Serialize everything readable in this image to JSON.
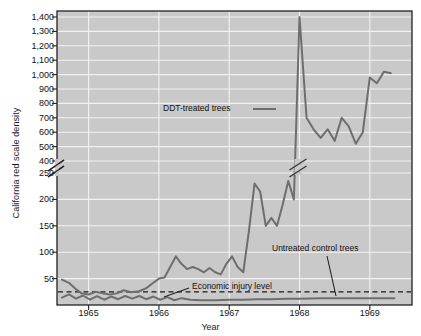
{
  "chart_data": {
    "type": "line",
    "title": "",
    "xlabel": "Year",
    "ylabel": "California red scale density",
    "xlim": [
      1964.55,
      1969.6
    ],
    "grid": true,
    "legend_position": "inline-annotations",
    "axis_break": {
      "present": true,
      "between": [
        250,
        400
      ],
      "note": "broken y-axis; lower segment 0-250 compressed relative to upper 400-1400"
    },
    "xticks": [
      1965,
      1966,
      1967,
      1968,
      1969
    ],
    "xtick_labels": [
      "1965",
      "1966",
      "1967",
      "1968",
      "1969"
    ],
    "yticks": [
      50,
      100,
      150,
      200,
      250,
      400,
      500,
      600,
      700,
      800,
      900,
      1000,
      1100,
      1200,
      1300,
      1400
    ],
    "ytick_labels": [
      "50",
      "100",
      "150",
      "200",
      "250",
      "400",
      "500",
      "600",
      "700",
      "800",
      "900",
      "1,000",
      "1,100",
      "1,200",
      "1,300",
      "1,400"
    ],
    "annotations": [
      {
        "name": "ddt-treated-trees",
        "text": "DDT-treated trees"
      },
      {
        "name": "untreated-control-trees",
        "text": "Untreated control trees"
      },
      {
        "name": "economic-injury-level",
        "text": "Economic injury level"
      }
    ],
    "reference_lines": [
      {
        "name": "economic-injury-level-line",
        "value": 25,
        "style": "dashed",
        "label": "Economic injury level"
      }
    ],
    "series": [
      {
        "name": "DDT-treated trees",
        "color": "#6e6e6e",
        "x": [
          1964.62,
          1964.72,
          1964.82,
          1964.9,
          1965.0,
          1965.1,
          1965.2,
          1965.3,
          1965.4,
          1965.5,
          1965.6,
          1965.72,
          1965.82,
          1965.92,
          1966.0,
          1966.08,
          1966.16,
          1966.24,
          1966.32,
          1966.4,
          1966.48,
          1966.56,
          1966.64,
          1966.72,
          1966.8,
          1966.88,
          1966.96,
          1967.04,
          1967.12,
          1967.2,
          1967.28,
          1967.36,
          1967.44,
          1967.52,
          1967.6,
          1967.68,
          1967.76,
          1967.84,
          1967.92,
          1968.0,
          1968.1,
          1968.2,
          1968.3,
          1968.4,
          1968.5,
          1968.6,
          1968.7,
          1968.8,
          1968.9,
          1969.0,
          1969.1,
          1969.2,
          1969.3
        ],
        "y": [
          48,
          42,
          30,
          22,
          20,
          25,
          22,
          20,
          22,
          28,
          24,
          26,
          32,
          42,
          50,
          52,
          72,
          92,
          78,
          68,
          72,
          68,
          62,
          70,
          62,
          58,
          78,
          92,
          72,
          62,
          140,
          230,
          215,
          150,
          165,
          150,
          190,
          235,
          200,
          1400,
          700,
          620,
          560,
          620,
          540,
          700,
          640,
          520,
          600,
          980,
          940,
          1020,
          1010
        ]
      },
      {
        "name": "Untreated control trees",
        "color": "#6e6e6e",
        "x": [
          1964.62,
          1964.72,
          1964.82,
          1964.92,
          1965.02,
          1965.12,
          1965.22,
          1965.32,
          1965.42,
          1965.52,
          1965.62,
          1965.72,
          1965.82,
          1965.92,
          1966.02,
          1966.12,
          1966.22,
          1966.32,
          1966.45,
          1966.6,
          1966.8,
          1967.0,
          1967.2,
          1967.4,
          1967.6,
          1967.8,
          1968.0,
          1968.3,
          1968.6,
          1968.9,
          1969.2,
          1969.35
        ],
        "y": [
          14,
          20,
          12,
          18,
          10,
          17,
          10,
          16,
          11,
          17,
          12,
          17,
          11,
          16,
          10,
          15,
          9,
          13,
          10,
          9,
          9,
          10,
          10,
          11,
          11,
          12,
          12,
          13,
          13,
          13,
          13,
          13
        ]
      }
    ]
  },
  "axis_titles": {
    "y": "California red scale density",
    "x": "Year"
  }
}
